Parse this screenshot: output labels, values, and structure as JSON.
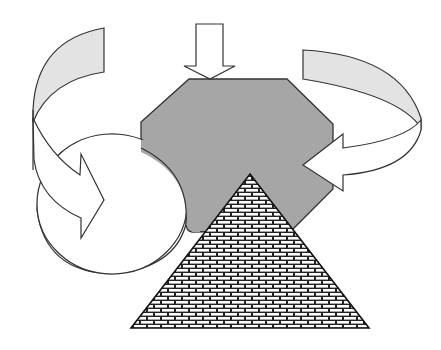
{
  "diagram": {
    "colors": {
      "background": "#ffffff",
      "octagon_fill": "#a6a6a6",
      "band_fill": "#e3e3e3",
      "arrow_fill": "#ffffff",
      "stroke": "#333333",
      "brick_mortar": "#222222",
      "brick_fill": "#ffffff"
    },
    "shapes": [
      {
        "id": "top-arrow",
        "type": "down-arrow",
        "tip": [
          210,
          79
        ]
      },
      {
        "id": "octagon",
        "type": "octagon",
        "fill": "gray"
      },
      {
        "id": "circle",
        "type": "ellipse",
        "center": [
          112,
          204
        ],
        "rx": 75,
        "ry": 70
      },
      {
        "id": "left-curved-arrow",
        "type": "curved-arrow",
        "direction": "clockwise-down-into-circle",
        "tip": [
          104,
          200
        ]
      },
      {
        "id": "right-curved-arrow",
        "type": "curved-arrow",
        "direction": "wrap-right-into-octagon",
        "tip": [
          303,
          165
        ]
      },
      {
        "id": "pyramid",
        "type": "triangle",
        "pattern": "brick",
        "apex": [
          250,
          174
        ],
        "base": [
          [
            131,
            328
          ],
          [
            369,
            328
          ]
        ]
      }
    ]
  }
}
